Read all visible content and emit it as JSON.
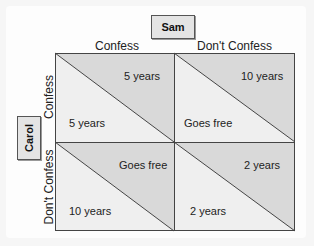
{
  "players": {
    "column": "Sam",
    "row": "Carol"
  },
  "columns": [
    "Confess",
    "Don't Confess"
  ],
  "rows": [
    "Confess",
    "Don't Confess"
  ],
  "cells": [
    {
      "row": "Confess",
      "col": "Confess",
      "sam": "5 years",
      "carol": "5 years"
    },
    {
      "row": "Confess",
      "col": "Don't Confess",
      "sam": "10 years",
      "carol": "Goes free"
    },
    {
      "row": "Don't Confess",
      "col": "Confess",
      "sam": "Goes free",
      "carol": "10 years"
    },
    {
      "row": "Don't Confess",
      "col": "Don't Confess",
      "sam": "2 years",
      "carol": "2 years"
    }
  ],
  "colors": {
    "upper_triangle": "#d9d9d9",
    "lower_triangle": "#efefef",
    "line": "#444444"
  }
}
